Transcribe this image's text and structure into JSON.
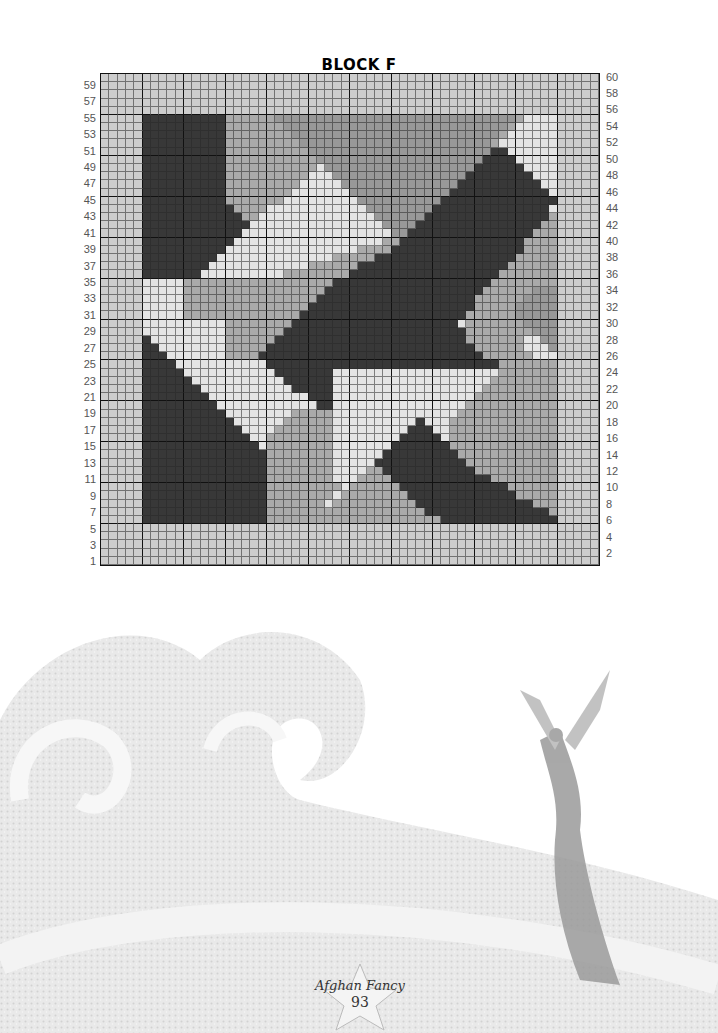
{
  "page": {
    "title": "BLOCK F",
    "footer_brand": "Afghan Fancy",
    "page_number": "93"
  },
  "chart_data": {
    "type": "heatmap",
    "title": "BLOCK F",
    "grid": {
      "columns": 60,
      "rows": 60,
      "major_every": 5
    },
    "left_row_labels": [
      "59",
      "57",
      "55",
      "53",
      "51",
      "49",
      "47",
      "45",
      "43",
      "41",
      "39",
      "37",
      "35",
      "33",
      "31",
      "29",
      "27",
      "25",
      "23",
      "21",
      "19",
      "17",
      "15",
      "13",
      "11",
      "9",
      "7",
      "5",
      "3",
      "1"
    ],
    "right_row_labels": [
      "60",
      "58",
      "56",
      "54",
      "52",
      "50",
      "48",
      "46",
      "44",
      "42",
      "40",
      "38",
      "36",
      "34",
      "32",
      "30",
      "28",
      "26",
      "24",
      "22",
      "20",
      "18",
      "16",
      "14",
      "12",
      "10",
      "8",
      "6",
      "4",
      "2"
    ],
    "legend": {
      "L": {
        "name": "border light gray",
        "color": "#cdcdcd"
      },
      "P": {
        "name": "pale gray",
        "color": "#e4e4e4"
      },
      "M": {
        "name": "medium gray",
        "color": "#aaaaaa"
      },
      "G": {
        "name": "mid-dark gray",
        "color": "#989898"
      },
      "D": {
        "name": "dark charcoal",
        "color": "#383838"
      }
    },
    "rows_top_to_bottom": [
      "LLLLLLLLLLLLLLLLLLLLLLLLLLLLLLLLLLLLLLLLLLLLLLLLLLLLLLLLLLLL",
      "LLLLLLLLLLLLLLLLLLLLLLLLLLLLLLLLLLLLLLLLLLLLLLLLLLLLLLLLLLLL",
      "LLLLLLLLLLLLLLLLLLLLLLLLLLLLLLLLLLLLLLLLLLLLLLLLLLLLLLLLLLLL",
      "LLLLLLLLLLLLLLLLLLLLLLLLLLLLLLLLLLLLLLLLLLLLLLLLLLLLLLLLLLLL",
      "LLLLLLLLLLLLLLLLLLLLLLLLLLLLLLLLLLLLLLLLLLLLLLLLLLLLLLLLLLLL",
      "LLLLLDDDDDDDDDDMMMMMMGGGGGGGGGGGGGGGGGGGGGGGGGGGGGMPPPPLLLLL",
      "LLLLLDDDDDDDDDDMMMMMMMGGGGGGGGGGGGGGGGGGGGGGGGGGGMPPPPPLLLLL",
      "LLLLLDDDDDDDDDDMMMMMMMMGGGGGGGGGGGGGGGGGGGGGGGGGMPPPPPPLLLLL",
      "LLLLLDDDDDDDDDDMMMMMMMMMGGGGGGGGGGGGGGGGGGGGGGGMPPPPPPPLLLLL",
      "LLLLLDDDDDDDDDDMMMMMMMMMMGGGGGGGGGGGGGGGGGGGGGGDDPPPPPPLLLLL",
      "LLLLLDDDDDDDDDDMMMMMMMMMMMGGGGGGGGGGGGGGGGGGGGDDDDPPPPPLLLLL",
      "LLLLLDDDDDDDDDDMMMMMMMMMMMPGGGGGGGGGGGGGGGGGGDDDDDDPPPPLLLLL",
      "LLLLLDDDDDDDDDDMMMMMMMMMMPPPGGGGGGGGGGGGGGGGDDDDDDDDPPPLLLLL",
      "LLLLLDDDDDDDDDDMMMMMMMMMPPPPPGGGGGGGGGGGGGGDDDDDDDDDDPPLLLLL",
      "LLLLLDDDDDDDDDDMMMMMMMMPPPPPPPGGGGGGGGGGGGDDDDDDDDDDDDPLLLLL",
      "LLLLLDDDDDDDDDDMMMMMMMPPPPPPPPPGGGGGGGGGGDDDDDDDDDDDDDDLLLLL",
      "LLLLLDDDDDDDDDDDMMMMPPPPPPPPPPPPGGGGGGGGDDDDDDDDDDDDDDPLLLLL",
      "LLLLLDDDDDDDDDDDDMMPPPPPPPPPPPPPPGGGGGGDDDDDDDDDDDDDDDMLLLLL",
      "LLLLLDDDDDDDDDDDDDPPPPPPPPPPPPPPPPGGGGDDDDDDDDDDDDDDDMMLLLLL",
      "LLLLLDDDDDDDDDDDDPPPPPPPPPPPPPPPPPPGGDDDDDDDDDDDDDDDMMMLLLLL",
      "LLLLLDDDDDDDDDDDPPPPPPPPPPPPPPPPPPMMDDDDDDDDDDDDDDDMMMMLLLLL",
      "LLLLLDDDDDDDDDDPPPPPPPPPPPPPPPPMMMMDDDDDDDDDDDDDDDDMMMMLLLLL",
      "LLLLLDDDDDDDDDPPPPPPPPPPPPPPMMMMMDDDDDDDDDDDDDDDDDMMMMMLLLLL",
      "LLLLLDDDDDDDDPPPPPPPPPPPPMMMMMMDDDDDDDDDDDDDDDDDDMMMMMMLLLLL",
      "LLLLLDDDDDDDPPPPPPPPPPMMMMMMMMDDDDDDDDDDDDDDDDDDMMMMMMMLLLLL",
      "LLLLLPPPPPMMMMMMMMMMMMMMMMMMDDDDDDDDDDDDDDDDDDDMMMMMMMMLLLLL",
      "LLLLLPPPPPMMMMMMMMMMMMMMMMMDDDDDDDDDDDDDDDDDDDMMMMMMGGGLLLLL",
      "LLLLLPPPPPMMMMMMMMMMMMMMMMDDDDDDDDDDDDDDDDDDDMMMMMMGGGGLLLLL",
      "LLLLLPPPPPMMMMMMMMMMMMMMMDDDDDDDDDDDDDDDDDDDDMMMMMGGGGGLLLLL",
      "LLLLLPPPPPMMMMMMMMMMMMMMDDDDDDDDDDDDDDDDDDDDMMMMMMGGGGGLLLLL",
      "LLLLLPPPPPPPPPPMMMMMMMMDDDDDDDDDDDDDDDDDDDDPMMMMMMMGGGGLLLLL",
      "LLLLLPPPPPPPPPPMMMMMMMDDDDDDDDDDDDDDDDDDDDDDMMMMMMMMGGGLLLLL",
      "LLLLLDPPPPPPPPPMMMMMMDDDDDDDDDDDDDDDDDDDDDDDMMMMMMMPPGGLLLLL",
      "LLLLLDDPPPPPPPPMMMMMDDDDDDDDDDDDDDDDDDDDDDDDDMMMMMMPPPGLLLLL",
      "LLLLLDDDPPPPPPPMMMMDDDDDDDDDDDDDDDDDDDDDDDDDDDMMMMMMPPPLLLLL",
      "LLLLLDDDDPPPPPPPPPPPDDDDDDDDDDDDDDDDDDDDDDDDDDDDMMMMMMMLLLLL",
      "LLLLLDDDDDPPPPPPPPPPPDDDDDDDPPPPPPPPPPPPPPPPPPPPMMMMMMMLLLLL",
      "LLLLLDDDDDDPPPPPPPPPPPDDDDDDPPPPPPPPPPPPPPPPPPPMMMMMMMMLLLLL",
      "LLLLLDDDDDDDPPPPPPPPPPPDDDDDPPPPPPPPPPPPPPPPPPMMMMMMMMMLLLLL",
      "LLLLLDDDDDDDDPPPPPPPPPPPPDDDPPPPPPPPPPPPPPPPPMMMMMMMMMMLLLLL",
      "LLLLLDDDDDDDDDPPPPPPPPPPPPDDPPPPPPPPPPPPPPPPMMMMMMMMMMMLLLLL",
      "LLLLLDDDDDDDDDDPPPPPPPPMMMMMPPPPPPPPPPPPPPPMMMMMMMMMMMMLLLLL",
      "LLLLLDDDDDDDDDDDPPPPPPMMMMMMPPPPPPPPPPDPPPMMMMMMMMMMMMMLLLLL",
      "LLLLLDDDDDDDDDDDDPPPPMMMMMMMPPPPPPPPPDDDPPMMMMMMMMMMMMMLLLLL",
      "LLLLLDDDDDDDDDDDDDPPMMMMMMMMPPPPPPPPDDDDDPMMMMMMMMMMMMMLLLLL",
      "LLLLLDDDDDDDDDDDDDDPMMMMMMMMPPPPPPPDDDDDDDMMMMMMMMMMMMMLLLLL",
      "LLLLLDDDDDDDDDDDDDDDMMMMMMMMPPPPPPDDDDDDDDDMMMMMMMMMMMMLLLLL",
      "LLLLLDDDDDDDDDDDDDDDMMMMMMMMPPPPPDDDDDDDDDDDMMMMMMMMMMMLLLLL",
      "LLLLLDDDDDDDDDDDDDDDMMMMMMMMPPPPMMDDDDDDDDDDDMMMMMMMMMMLLLLL",
      "LLLLLDDDDDDDDDDDDDDDMMMMMMMMPPPMMMMDDDDDDDDDDDDMMMMMMMMLLLLL",
      "LLLLLDDDDDDDDDDDDDDDMMMMMMMMMPMMMMMMDDDDDDDDDDDDDMMMMMMLLLLL",
      "LLLLLDDDDDDDDDDDDDDDMMMMMMMMPMMMMMMMMDDDDDDDDDDDDDMMMMMLLLLL",
      "LLLLLDDDDDDDDDDDDDDDMMMMMMMPMMMMMMMMMMDDDDDDDDDDDDDDMMMLLLLL",
      "LLLLLDDDDDDDDDDDDDDDMMMMMMMMMMMMMMMMMMMDDDDDDDDDDDDDDDMLLLLL",
      "LLLLLDDDDDDDDDDDDDDDMMMMMMMMMMMMMMMMMMMMMDDDDDDDDDDDDDDLLLLL",
      "LLLLLLLLLLLLLLLLLLLLLLLLLLLLLLLLLLLLLLLLLLLLLLLLLLLLLLLLLLLL",
      "LLLLLLLLLLLLLLLLLLLLLLLLLLLLLLLLLLLLLLLLLLLLLLLLLLLLLLLLLLLL",
      "LLLLLLLLLLLLLLLLLLLLLLLLLLLLLLLLLLLLLLLLLLLLLLLLLLLLLLLLLLLL",
      "LLLLLLLLLLLLLLLLLLLLLLLLLLLLLLLLLLLLLLLLLLLLLLLLLLLLLLLLLLLL",
      "LLLLLLLLLLLLLLLLLLLLLLLLLLLLLLLLLLLLLLLLLLLLLLLLLLLLLLLLLLLL"
    ]
  }
}
